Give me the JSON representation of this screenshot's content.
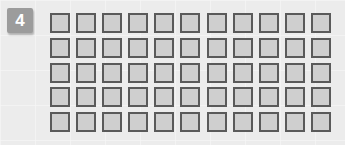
{
  "badge": {
    "number": "4",
    "color": "#9c9c9c"
  },
  "grid": {
    "rows": 5,
    "columns": 11,
    "cell_fill": "#cfcfcf",
    "cell_border": "#5a5a5a",
    "cells": [
      [
        0,
        0,
        0,
        0,
        0,
        0,
        0,
        0,
        0,
        0,
        0
      ],
      [
        0,
        0,
        0,
        0,
        0,
        0,
        0,
        0,
        0,
        0,
        0
      ],
      [
        0,
        0,
        0,
        0,
        0,
        0,
        0,
        0,
        0,
        0,
        0
      ],
      [
        0,
        0,
        0,
        0,
        0,
        0,
        0,
        0,
        0,
        0,
        0
      ],
      [
        0,
        0,
        0,
        0,
        0,
        0,
        0,
        0,
        0,
        0,
        0
      ]
    ]
  }
}
